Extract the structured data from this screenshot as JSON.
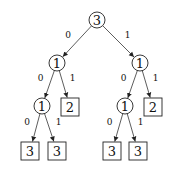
{
  "tree": {
    "nodes": [
      {
        "id": "n0",
        "shape": "circle",
        "label": "3",
        "x": 97,
        "y": 20
      },
      {
        "id": "n1",
        "shape": "circle",
        "label": "1",
        "x": 57,
        "y": 63
      },
      {
        "id": "n2",
        "shape": "circle",
        "label": "1",
        "x": 140,
        "y": 63
      },
      {
        "id": "n3",
        "shape": "circle",
        "label": "1",
        "x": 42,
        "y": 106
      },
      {
        "id": "n4",
        "shape": "box",
        "label": "2",
        "x": 70,
        "y": 107
      },
      {
        "id": "n5",
        "shape": "circle",
        "label": "1",
        "x": 125,
        "y": 106
      },
      {
        "id": "n6",
        "shape": "box",
        "label": "2",
        "x": 153,
        "y": 107
      },
      {
        "id": "n7",
        "shape": "box",
        "label": "3",
        "x": 30,
        "y": 151
      },
      {
        "id": "n8",
        "shape": "box",
        "label": "3",
        "x": 57,
        "y": 151
      },
      {
        "id": "n9",
        "shape": "box",
        "label": "3",
        "x": 112,
        "y": 151
      },
      {
        "id": "n10",
        "shape": "box",
        "label": "3",
        "x": 138,
        "y": 151
      }
    ],
    "edges": [
      {
        "from": "n0",
        "to": "n1",
        "label": "0"
      },
      {
        "from": "n0",
        "to": "n2",
        "label": "1"
      },
      {
        "from": "n1",
        "to": "n3",
        "label": "0"
      },
      {
        "from": "n1",
        "to": "n4",
        "label": "1"
      },
      {
        "from": "n2",
        "to": "n5",
        "label": "0"
      },
      {
        "from": "n2",
        "to": "n6",
        "label": "1"
      },
      {
        "from": "n3",
        "to": "n7",
        "label": "0"
      },
      {
        "from": "n3",
        "to": "n8",
        "label": "1"
      },
      {
        "from": "n5",
        "to": "n9",
        "label": "0"
      },
      {
        "from": "n5",
        "to": "n10",
        "label": "1"
      }
    ]
  }
}
